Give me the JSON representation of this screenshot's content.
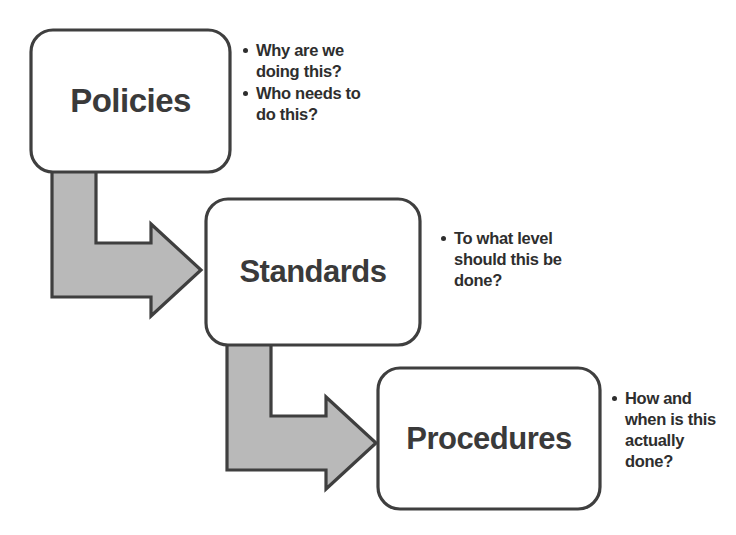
{
  "diagram": {
    "background_color": "#ffffff",
    "box_fill_color": "#ffffff",
    "box_stroke_color": "#3f3f3f",
    "arrow_fill_color": "#b9b9b9",
    "arrow_stroke_color": "#3f3f3f",
    "text_color": "#2e2e2e",
    "nodes": [
      {
        "id": "policies",
        "label": "Policies",
        "font_size": "33px",
        "annotation": [
          {
            "lines": [
              "Why are we",
              "doing this?"
            ]
          },
          {
            "lines": [
              "Who needs to",
              "do this?"
            ]
          }
        ]
      },
      {
        "id": "standards",
        "label": "Standards",
        "font_size": "31px",
        "annotation": [
          {
            "lines": [
              "To what level",
              "should this be",
              "done?"
            ]
          }
        ]
      },
      {
        "id": "procedures",
        "label": "Procedures",
        "font_size": "31px",
        "annotation": [
          {
            "lines": [
              "How and",
              "when is this",
              "actually",
              "done?"
            ]
          }
        ]
      }
    ],
    "connectors": [
      {
        "id": "policies-to-standards",
        "from": "policies",
        "to": "standards",
        "shape": "elbow-arrow-down-right"
      },
      {
        "id": "standards-to-procedures",
        "from": "standards",
        "to": "procedures",
        "shape": "elbow-arrow-down-right"
      }
    ]
  }
}
